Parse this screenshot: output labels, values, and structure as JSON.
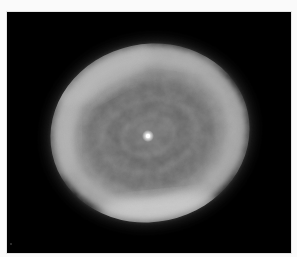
{
  "image": {
    "subject": "planetary nebula",
    "description": "Grayscale astronomical photograph of an elliptical planetary nebula with concentric spiral-like shells and a bright central star, on a black background",
    "background_color": "#000000",
    "page_color": "#fafafa"
  },
  "nebula": {
    "center": [
      143,
      121
    ],
    "rx": 101,
    "ry": 90,
    "rotation_deg": -12,
    "rim_color": "#c8c8c8",
    "inner_color": "#6e6e6e",
    "bright_regions": [
      "left rim",
      "upper-left rim",
      "bottom rim"
    ]
  },
  "central_star": {
    "position": [
      141,
      124
    ],
    "color": "#ffffff"
  },
  "specks": [
    {
      "x": 3,
      "y": 231
    }
  ]
}
